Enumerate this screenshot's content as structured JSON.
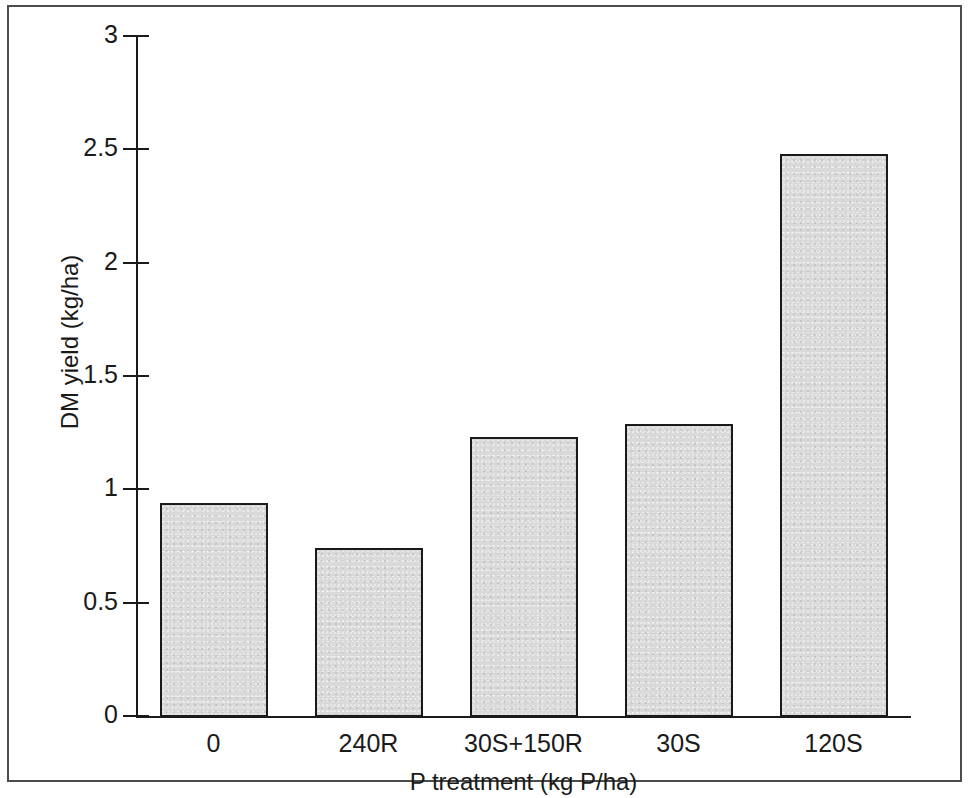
{
  "chart_data": {
    "type": "bar",
    "title": "",
    "subtitle": "",
    "xlabel": "P treatment (kg P/ha)",
    "ylabel": "DM yield (kg/ha)",
    "categories": [
      "0",
      "240R",
      "30S+150R",
      "30S",
      "120S"
    ],
    "values": [
      0.94,
      0.74,
      1.23,
      1.29,
      2.48
    ],
    "ylim": [
      0,
      3
    ],
    "yticks": [
      "0",
      "0.5",
      "1",
      "1.5",
      "2",
      "2.5",
      "3"
    ],
    "ytick_values": [
      0,
      0.5,
      1,
      1.5,
      2,
      2.5,
      3
    ],
    "grid": false,
    "legend": null,
    "bar_fill_color": "#d9d9d9",
    "bar_edge_color": "#1a1a1a",
    "axis_color": "#1a1a1a",
    "background_color": "#ffffff",
    "frame_color": "#4c4c4c"
  },
  "figure": {
    "border_present": true
  }
}
